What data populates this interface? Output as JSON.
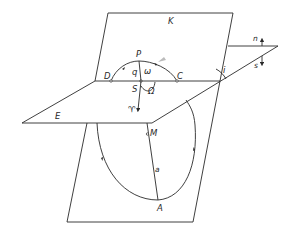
{
  "diagram": {
    "planes": {
      "sky_plane": "K",
      "ecliptic_plane": "E"
    },
    "labels": {
      "K": "K",
      "E": "E",
      "P": "P",
      "D": "D",
      "C": "C",
      "S": "S",
      "q": "q",
      "omega": "ω",
      "Omega": "Ω",
      "vernal_equinox": "♈",
      "i": "i",
      "n": "n",
      "s": "s",
      "M": "M",
      "a": "a",
      "A": "A"
    },
    "notes": {
      "line_of_nodes": "Line DC through S",
      "arc": "Arc D–P–C with direction arrows",
      "orbit": "Elliptical orbit below plane E with perihelion-direction arrows, point A (aphelion) and focus M",
      "semi_major_axis": "Segment M–A labeled a",
      "inclination": "Angle i between planes at line of nodes",
      "north_south": "Arrows n (up) and s (down) at right"
    }
  }
}
